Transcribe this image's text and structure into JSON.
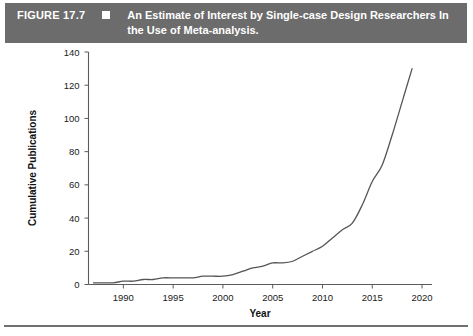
{
  "caption": {
    "figure_number": "FIGURE 17.7",
    "marker": "square-bullet",
    "text": "An Estimate of Interest by Single-case Design Researchers In the Use of Meta-analysis.",
    "bar_color": "#6c6c6c",
    "text_color": "#ffffff"
  },
  "chart_data": {
    "type": "line",
    "title": "An Estimate of Interest by Single-case Design Researchers In the Use of Meta-analysis.",
    "xlabel": "Year",
    "ylabel": "Cumulative Publications",
    "xlim": [
      1986.5,
      2021
    ],
    "ylim": [
      0,
      140
    ],
    "xticks": [
      1990,
      1995,
      2000,
      2005,
      2010,
      2015,
      2020
    ],
    "xtick_labels": [
      "1990",
      "1995",
      "2000",
      "2005",
      "2010",
      "2015",
      "2020"
    ],
    "yticks": [
      0,
      20,
      40,
      60,
      80,
      100,
      120,
      140
    ],
    "ytick_labels": [
      "0",
      "20",
      "40",
      "60",
      "80",
      "100",
      "120",
      "140"
    ],
    "grid": false,
    "legend": false,
    "line_color": "#555555",
    "x": [
      1987,
      1988,
      1989,
      1990,
      1991,
      1992,
      1993,
      1994,
      1995,
      1996,
      1997,
      1998,
      1999,
      2000,
      2001,
      2002,
      2003,
      2004,
      2005,
      2006,
      2007,
      2008,
      2009,
      2010,
      2011,
      2012,
      2013,
      2014,
      2015,
      2016,
      2017,
      2018,
      2019
    ],
    "values": [
      1,
      1,
      1,
      2,
      2,
      3,
      3,
      4,
      4,
      4,
      4,
      5,
      5,
      5,
      6,
      8,
      10,
      11,
      13,
      13,
      14,
      17,
      20,
      23,
      28,
      33,
      37,
      48,
      62,
      72,
      90,
      110,
      130
    ],
    "series": [
      {
        "name": "Cumulative Publications",
        "values": [
          1,
          1,
          1,
          2,
          2,
          3,
          3,
          4,
          4,
          4,
          4,
          5,
          5,
          5,
          6,
          8,
          10,
          11,
          13,
          13,
          14,
          17,
          20,
          23,
          28,
          33,
          37,
          48,
          62,
          72,
          90,
          110,
          130
        ]
      }
    ]
  }
}
